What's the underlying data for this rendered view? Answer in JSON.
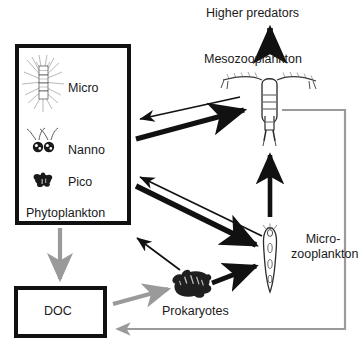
{
  "diagram": {
    "background_color": "#ffffff",
    "black": "#111111",
    "gray": "#9a9a9a"
  },
  "boxes": {
    "phytoplankton": {
      "label": "Phytoplankton",
      "border_color": "#111111"
    },
    "doc": {
      "label": "DOC",
      "border_color": "#111111"
    }
  },
  "size_classes": [
    {
      "label": "Micro",
      "organism": "diatom-chain-icon"
    },
    {
      "label": "Nanno",
      "organism": "flagellate-pair-icon"
    },
    {
      "label": "Pico",
      "organism": "picoplankton-cluster-icon"
    }
  ],
  "nodes": {
    "higher_predators": {
      "label": "Higher predators"
    },
    "mesozooplankton": {
      "label": "Mesozooplankton",
      "organism": "copepod-icon"
    },
    "microzooplankton": {
      "label": "Micro-\nzooplankton",
      "line1": "Micro-",
      "line2": "zooplankton",
      "organism": "ciliate-icon"
    },
    "prokaryotes": {
      "label": "Prokaryotes",
      "organism": "bacteria-cluster-icon"
    }
  },
  "flows": [
    {
      "from": "mesozooplankton",
      "to": "higher_predators",
      "style": "thick-black"
    },
    {
      "from": "phytoplankton",
      "to": "mesozooplankton",
      "style": "thick-black"
    },
    {
      "from": "mesozooplankton",
      "to": "phytoplankton",
      "style": "thin-black"
    },
    {
      "from": "phytoplankton",
      "to": "microzooplankton",
      "style": "thick-black"
    },
    {
      "from": "microzooplankton",
      "to": "phytoplankton",
      "style": "thin-black"
    },
    {
      "from": "microzooplankton",
      "to": "mesozooplankton",
      "style": "thick-black"
    },
    {
      "from": "prokaryotes",
      "to": "microzooplankton",
      "style": "thick-black"
    },
    {
      "from": "prokaryotes",
      "to": "phytoplankton",
      "style": "thin-black"
    },
    {
      "from": "phytoplankton",
      "to": "doc",
      "style": "gray"
    },
    {
      "from": "doc",
      "to": "prokaryotes",
      "style": "gray"
    },
    {
      "from": "mesozooplankton",
      "to": "doc",
      "style": "gray-routed"
    }
  ]
}
